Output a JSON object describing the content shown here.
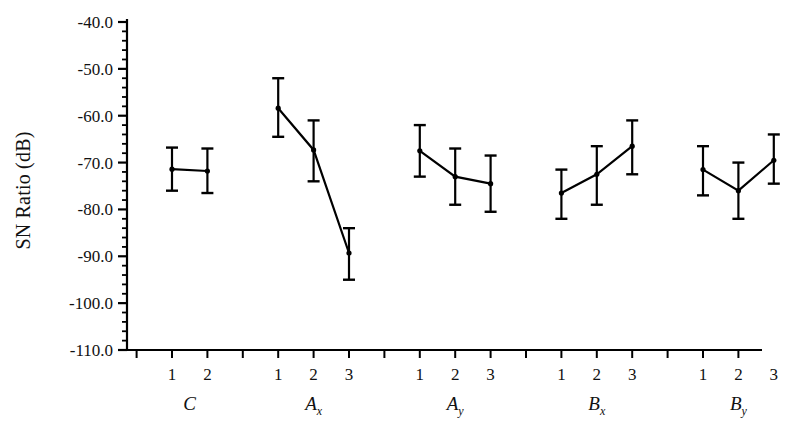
{
  "chart_data": {
    "type": "scatter",
    "title": "",
    "xlabel": "",
    "ylabel": "SN Ratio (dB)",
    "ylim": [
      -110.0,
      -40.0
    ],
    "ytick_labels": [
      "-40.0",
      "-50.0",
      "-60.0",
      "-70.0",
      "-80.0",
      "-90.0",
      "-100.0",
      "-110.0"
    ],
    "ytick_values": [
      -40.0,
      -50.0,
      -60.0,
      -70.0,
      -80.0,
      -90.0,
      -100.0,
      -110.0
    ],
    "yminor_step": 2.0,
    "grid": false,
    "legend": null,
    "error_bars": true,
    "error_bar_kind": "mean with capped range",
    "groups": [
      {
        "name": "C",
        "label": "C",
        "subscript": "",
        "levels": [
          "1",
          "2"
        ],
        "values": [
          -71.4,
          -71.8
        ],
        "err_low": [
          -76.0,
          -76.5
        ],
        "err_high": [
          -66.8,
          -67.0
        ]
      },
      {
        "name": "Ax",
        "label": "A",
        "subscript": "x",
        "levels": [
          "1",
          "2",
          "3"
        ],
        "values": [
          -58.4,
          -67.3,
          -89.3
        ],
        "err_low": [
          -64.5,
          -74.0,
          -95.0
        ],
        "err_high": [
          -52.0,
          -61.0,
          -84.0
        ]
      },
      {
        "name": "Ay",
        "label": "A",
        "subscript": "y",
        "levels": [
          "1",
          "2",
          "3"
        ],
        "values": [
          -67.5,
          -73.0,
          -74.5
        ],
        "err_low": [
          -73.0,
          -79.0,
          -80.5
        ],
        "err_high": [
          -62.0,
          -67.0,
          -68.5
        ]
      },
      {
        "name": "Bx",
        "label": "B",
        "subscript": "x",
        "levels": [
          "1",
          "2",
          "3"
        ],
        "values": [
          -76.5,
          -72.5,
          -66.5
        ],
        "err_low": [
          -82.0,
          -79.0,
          -72.5
        ],
        "err_high": [
          -71.5,
          -66.5,
          -61.0
        ]
      },
      {
        "name": "By",
        "label": "B",
        "subscript": "y",
        "levels": [
          "1",
          "2",
          "3"
        ],
        "values": [
          -71.5,
          -76.0,
          -69.5
        ],
        "err_low": [
          -77.0,
          -82.0,
          -74.5
        ],
        "err_high": [
          -66.5,
          -70.0,
          -64.0
        ]
      }
    ]
  },
  "axis": {
    "y_label_text": "SN Ratio (dB)",
    "line_color": "#000000",
    "marker_color": "#000000"
  }
}
